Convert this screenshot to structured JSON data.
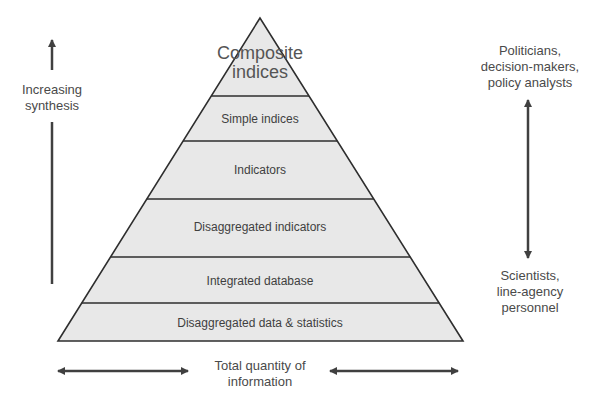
{
  "diagram": {
    "type": "pyramid",
    "layers": [
      {
        "label": "Composite indices"
      },
      {
        "label": "Simple indices"
      },
      {
        "label": "Indicators"
      },
      {
        "label": "Disaggregated indicators"
      },
      {
        "label": "Integrated database"
      },
      {
        "label": "Disaggregated data & statistics"
      }
    ],
    "left_axis": {
      "label_line1": "Increasing",
      "label_line2": "synthesis"
    },
    "right_axis": {
      "top_label": [
        "Politicians,",
        "decision-makers,",
        "policy analysts"
      ],
      "bottom_label": [
        "Scientists,",
        "line-agency",
        "personnel"
      ]
    },
    "bottom_axis": {
      "label_line1": "Total quantity of",
      "label_line2": "information"
    },
    "colors": {
      "fill": "#e8e8e8",
      "stroke": "#2e2e2e",
      "arrow": "#404040"
    }
  }
}
